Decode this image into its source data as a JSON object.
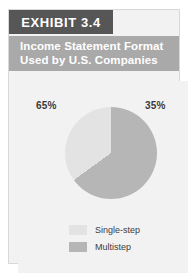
{
  "exhibit": {
    "tab_label": "EXHIBIT 3.4",
    "title_line1": "Income Statement Format",
    "title_line2": "Used by U.S. Companies"
  },
  "colors": {
    "tab_background": "#565656",
    "title_background": "#a9a9a9",
    "card_background": "#f2f2f2",
    "single_step": "#e3e3e3",
    "multistep": "#b6b6b6",
    "label_text": "#3a3a3a"
  },
  "labels": {
    "left_percent": "65%",
    "right_percent": "35%"
  },
  "legend": {
    "items": [
      {
        "label": "Single-step",
        "color": "#e3e3e3"
      },
      {
        "label": "Multistep",
        "color": "#b6b6b6"
      }
    ]
  },
  "chart_data": {
    "type": "pie",
    "title": "Income Statement Format Used by U.S. Companies",
    "categories": [
      "Multistep",
      "Single-step"
    ],
    "values": [
      65,
      35
    ],
    "value_labels": [
      "65%",
      "35%"
    ],
    "colors": [
      "#b6b6b6",
      "#e3e3e3"
    ],
    "start_angle_deg": 0,
    "direction": "clockwise",
    "legend_position": "bottom",
    "grid": false,
    "units": "percent"
  }
}
